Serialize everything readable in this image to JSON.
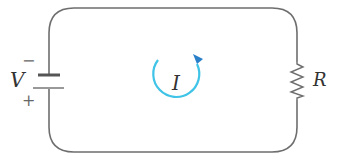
{
  "diagram": {
    "type": "circuit",
    "labels": {
      "voltage": "V",
      "current": "I",
      "resistance": "R",
      "battery_negative": "−",
      "battery_positive": "+"
    },
    "components": [
      {
        "kind": "battery",
        "label": "V",
        "position": "left"
      },
      {
        "kind": "resistor",
        "label": "R",
        "position": "right"
      },
      {
        "kind": "current-loop",
        "label": "I",
        "direction": "counterclockwise"
      }
    ],
    "colors": {
      "wire": "#6e6e6e",
      "current_arrow": "#3fc3e6",
      "text": "#333333"
    }
  }
}
